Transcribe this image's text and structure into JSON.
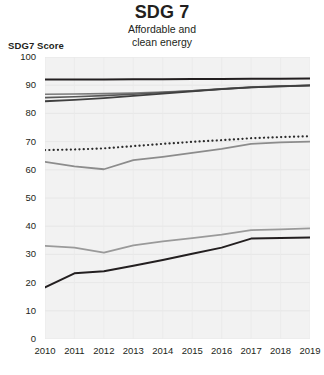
{
  "header": {
    "title": "SDG 7",
    "subtitle_line1": "Affordable and",
    "subtitle_line2": "clean energy"
  },
  "axis": {
    "y_label": "SDG7 Score"
  },
  "chart_data": {
    "type": "line",
    "title": "SDG 7",
    "subtitle": "Affordable and clean energy",
    "xlabel": "",
    "ylabel": "SDG7 Score",
    "x": [
      2010,
      2011,
      2012,
      2013,
      2014,
      2015,
      2016,
      2017,
      2018,
      2019
    ],
    "xticklabels": [
      "2010",
      "2011",
      "2012",
      "2013",
      "2014",
      "2015",
      "2016",
      "2017",
      "2018",
      "2019"
    ],
    "yticklabels": [
      "0",
      "10",
      "20",
      "30",
      "40",
      "50",
      "60",
      "70",
      "80",
      "90",
      "100"
    ],
    "yticks": [
      0,
      10,
      20,
      30,
      40,
      50,
      60,
      70,
      80,
      90,
      100
    ],
    "ylim": [
      0,
      100
    ],
    "xlim": [
      2010,
      2019
    ],
    "grid": true,
    "legend": "none",
    "plot_background": "#f2f2f2",
    "series": [
      {
        "name": "series-top-dark",
        "color": "#231f20",
        "style": "solid",
        "width": 2.0,
        "values": [
          92.0,
          92.0,
          92.0,
          92.1,
          92.1,
          92.2,
          92.2,
          92.3,
          92.3,
          92.4
        ]
      },
      {
        "name": "series-upper-a",
        "color": "#7a7a7a",
        "style": "solid",
        "width": 1.6,
        "values": [
          86.8,
          86.9,
          87.0,
          87.2,
          87.6,
          88.0,
          88.6,
          89.2,
          89.6,
          89.9
        ]
      },
      {
        "name": "series-upper-b",
        "color": "#595959",
        "style": "solid",
        "width": 1.6,
        "values": [
          85.6,
          85.9,
          86.3,
          86.8,
          87.4,
          88.0,
          88.7,
          89.3,
          89.7,
          90.0
        ]
      },
      {
        "name": "series-upper-c",
        "color": "#3f3f3f",
        "style": "solid",
        "width": 1.8,
        "values": [
          84.3,
          84.8,
          85.4,
          86.2,
          87.0,
          87.8,
          88.6,
          89.2,
          89.6,
          89.9
        ]
      },
      {
        "name": "series-dotted",
        "color": "#2b2b2b",
        "style": "dotted",
        "width": 2.2,
        "values": [
          67.0,
          67.2,
          67.6,
          68.4,
          69.2,
          69.9,
          70.5,
          71.2,
          71.6,
          71.9
        ]
      },
      {
        "name": "series-mid-gray",
        "color": "#8c8c8c",
        "style": "solid",
        "width": 1.8,
        "values": [
          62.8,
          61.2,
          60.2,
          63.4,
          64.6,
          66.0,
          67.4,
          69.2,
          69.7,
          70.0
        ]
      },
      {
        "name": "series-low-gray",
        "color": "#9a9a9a",
        "style": "solid",
        "width": 1.8,
        "values": [
          33.0,
          32.4,
          30.6,
          33.2,
          34.6,
          35.8,
          37.0,
          38.6,
          38.9,
          39.2
        ]
      },
      {
        "name": "series-low-dark",
        "color": "#231f20",
        "style": "solid",
        "width": 2.0,
        "values": [
          18.3,
          23.3,
          24.0,
          26.0,
          28.0,
          30.2,
          32.4,
          35.6,
          35.8,
          36.0
        ]
      }
    ]
  }
}
